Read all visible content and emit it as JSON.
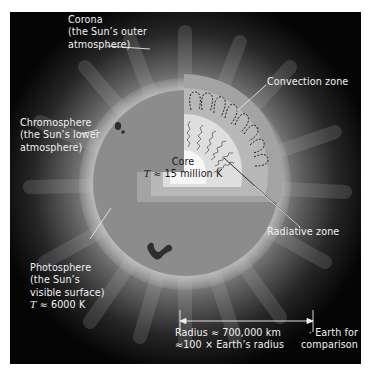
{
  "diagram": {
    "layers": [
      {
        "id": "corona",
        "lines": [
          "Corona",
          "(the Sun’s outer",
          "atmosphere)"
        ]
      },
      {
        "id": "chromosphere",
        "lines": [
          "Chromosphere",
          "(the Sun’s lower",
          "atmosphere)"
        ]
      },
      {
        "id": "photosphere",
        "lines": [
          "Photosphere",
          "(the Sun’s",
          "visible surface)"
        ],
        "temp_symbol": "T",
        "temp_value": "≈ 6000 K"
      },
      {
        "id": "convection",
        "lines": [
          "Convection zone"
        ]
      },
      {
        "id": "radiative",
        "lines": [
          "Radiative zone"
        ]
      },
      {
        "id": "core",
        "lines": [
          "Core"
        ],
        "temp_symbol": "T",
        "temp_value": "≈ 15 million K"
      }
    ],
    "scale": {
      "radius_line1": "Radius ≈ 700,000 km",
      "radius_line2": "≈100 × Earth’s radius"
    },
    "earth": {
      "marker": "·",
      "lines": [
        "Earth for",
        "comparison"
      ]
    },
    "colors": {
      "background": "#050505",
      "disk": "#8c8c8c",
      "convection": "#b4b4b4",
      "radiative": "#dcdcdc",
      "core": "#f7f7f7",
      "sunspot": "#2e2e2e",
      "label": "#f2f2f2"
    }
  }
}
